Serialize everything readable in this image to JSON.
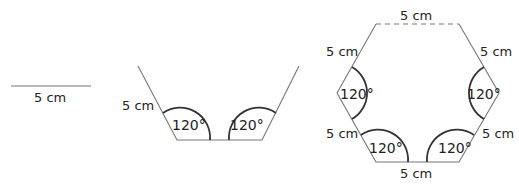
{
  "figure1": {
    "length_label": "5 cm"
  },
  "figure2": {
    "side_label": "5 cm",
    "angle_left": "120°",
    "angle_right": "120°"
  },
  "figure3": {
    "top_label": "5 cm",
    "upper_left_label": "5 cm",
    "upper_right_label": "5 cm",
    "lower_left_label": "5 cm",
    "lower_right_label": "5 cm",
    "bottom_label": "5 cm",
    "angle_left": "120°",
    "angle_right": "120°",
    "angle_bottom_left": "120°",
    "angle_bottom_right": "120°"
  },
  "colors": {
    "line": "#777777",
    "arc": "#333333",
    "text": "#222222"
  }
}
